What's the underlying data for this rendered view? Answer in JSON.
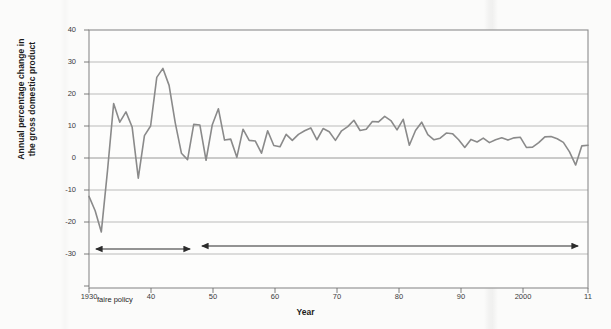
{
  "chart_data": {
    "type": "line",
    "title": "",
    "xlabel": "Year",
    "ylabel": "Annual percentage change in the gross domestic product",
    "xlim": [
      1930,
      2011
    ],
    "ylim": [
      -30,
      40
    ],
    "ytick_labels": [
      "40",
      "30",
      "20",
      "10",
      "0",
      "-10",
      "-20",
      "-30"
    ],
    "ytick_values": [
      40,
      30,
      20,
      10,
      0,
      -10,
      -20,
      -30
    ],
    "xtick_labels": [
      "1930",
      "40",
      "50",
      "60",
      "70",
      "80",
      "90",
      "2000",
      "11"
    ],
    "xtick_values": [
      1930,
      1940,
      1950,
      1960,
      1970,
      1980,
      1990,
      2000,
      2011
    ],
    "grid": "horizontal",
    "legend": "none",
    "line_color": "#8a8a8a",
    "series": [
      {
        "name": "Annual percentage change in GDP",
        "x": [
          1930,
          1931,
          1932,
          1933,
          1934,
          1935,
          1936,
          1937,
          1938,
          1939,
          1940,
          1941,
          1942,
          1943,
          1944,
          1945,
          1946,
          1947,
          1948,
          1949,
          1950,
          1951,
          1952,
          1953,
          1954,
          1955,
          1956,
          1957,
          1958,
          1959,
          1960,
          1961,
          1962,
          1963,
          1964,
          1965,
          1966,
          1967,
          1968,
          1969,
          1970,
          1971,
          1972,
          1973,
          1974,
          1975,
          1976,
          1977,
          1978,
          1979,
          1980,
          1981,
          1982,
          1983,
          1984,
          1985,
          1986,
          1987,
          1988,
          1989,
          1990,
          1991,
          1992,
          1993,
          1994,
          1995,
          1996,
          1997,
          1998,
          1999,
          2000,
          2001,
          2002,
          2003,
          2004,
          2005,
          2006,
          2007,
          2008,
          2009,
          2010,
          2011
        ],
        "values": [
          -12,
          -16.5,
          -23.1,
          -4.0,
          17.0,
          11.2,
          14.4,
          9.7,
          -6.3,
          7.0,
          10.0,
          25.2,
          28.0,
          22.7,
          11.0,
          1.5,
          -0.5,
          10.5,
          10.3,
          -0.7,
          10.3,
          15.4,
          5.6,
          5.9,
          0.2,
          9.0,
          5.5,
          5.3,
          1.5,
          8.5,
          3.9,
          3.5,
          7.4,
          5.5,
          7.4,
          8.5,
          9.4,
          5.7,
          9.2,
          8.2,
          5.5,
          8.5,
          9.8,
          11.8,
          8.6,
          9.0,
          11.4,
          11.3,
          13.0,
          11.7,
          8.8,
          12.1,
          4.0,
          8.6,
          11.2,
          7.3,
          5.7,
          6.2,
          7.8,
          7.6,
          5.7,
          3.3,
          5.8,
          5.0,
          6.2,
          4.8,
          5.7,
          6.3,
          5.6,
          6.3,
          6.5,
          3.3,
          3.4,
          4.8,
          6.6,
          6.7,
          6.0,
          4.9,
          1.9,
          -2.2,
          3.8,
          4.0
        ]
      }
    ],
    "annotations": [
      {
        "id": "laissez-faire",
        "text": "Period of laissez-\nfaire policy",
        "arrow": "double",
        "x_start": 1930,
        "x_end": 1945
      },
      {
        "id": "government-intervention",
        "text": "Period of strong government intervention in the economy",
        "arrow": "double",
        "x_start": 1945,
        "x_end": 2011
      }
    ]
  },
  "axes": {
    "y_title": "Annual percentage change in\nthe gross domestic product",
    "y_title_line1": "Annual percentage change in",
    "y_title_line2": "the gross domestic product",
    "x_title": "Year"
  },
  "annotations": {
    "laissez_faire": "Period of laissez-\nfaire policy",
    "laissez_faire_line1": "Period of laissez-",
    "laissez_faire_line2": "faire policy",
    "government": "Period of strong government intervention in the economy"
  },
  "colors": {
    "line": "#8a8a8a",
    "grid": "#aaaaaa",
    "frame": "#888888",
    "text": "#1b1b1b",
    "background": "#fbfbfa"
  }
}
